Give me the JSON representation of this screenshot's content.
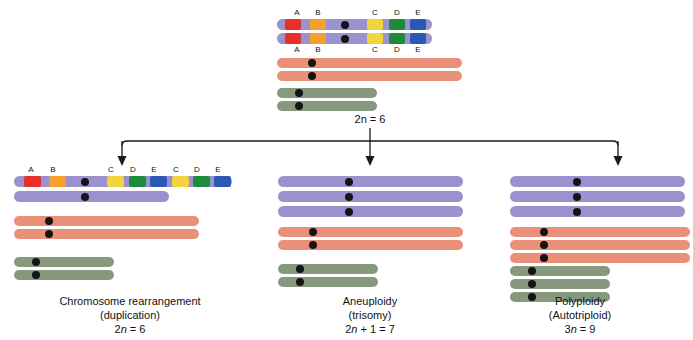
{
  "figure": {
    "colors": {
      "chrom_purple": "#9a91cf",
      "chrom_salmon": "#ea9079",
      "chrom_green": "#86997f",
      "band_a": "#e8302a",
      "band_b": "#f5a02a",
      "band_c": "#f2d43c",
      "band_d": "#1e8b3a",
      "band_e": "#2b58b4",
      "centromere": "#141414",
      "arrow": "#1a1a1a",
      "background": "#ffffff"
    },
    "band_labels": [
      "A",
      "B",
      "C",
      "D",
      "E"
    ]
  },
  "parent": {
    "ploidy_label": "2n = 6",
    "ploidy_prefix": "2",
    "ploidy_italic": "n",
    "ploidy_suffix": " = 6",
    "top_labels_above": [
      "A",
      "B",
      "C",
      "D",
      "E"
    ],
    "top_labels_below": [
      "A",
      "B",
      "C",
      "D",
      "E"
    ],
    "pairs": [
      {
        "name": "purple-pair",
        "color": "chrom_purple",
        "count": 2,
        "banded": true
      },
      {
        "name": "salmon-pair",
        "color": "chrom_salmon",
        "count": 2,
        "banded": false
      },
      {
        "name": "green-pair",
        "color": "chrom_green",
        "count": 2,
        "banded": false
      }
    ]
  },
  "branches": [
    {
      "id": "duplication",
      "caption_line1": "Chromosome rearrangement",
      "caption_line2": "(duplication)",
      "ploidy_prefix": "2",
      "ploidy_italic": "n",
      "ploidy_suffix": " = 6",
      "ploidy_label": "2n = 6",
      "labels_above": [
        "A",
        "B",
        "C",
        "D",
        "E",
        "C",
        "D",
        "E"
      ],
      "purple_count": 2,
      "salmon_count": 2,
      "green_count": 2
    },
    {
      "id": "aneuploidy",
      "caption_line1": "Aneuploidy",
      "caption_line2": "(trisomy)",
      "ploidy_prefix": "2",
      "ploidy_italic": "n",
      "ploidy_suffix": " + 1 = 7",
      "ploidy_label": "2n + 1 = 7",
      "labels_above": [],
      "purple_count": 3,
      "salmon_count": 2,
      "green_count": 2
    },
    {
      "id": "polyploidy",
      "caption_line1": "Polyploidy",
      "caption_line2": "(Autotriploid)",
      "ploidy_prefix": "3",
      "ploidy_italic": "n",
      "ploidy_suffix": " = 9",
      "ploidy_label": "3n = 9",
      "labels_above": [],
      "purple_count": 3,
      "salmon_count": 3,
      "green_count": 3
    }
  ]
}
